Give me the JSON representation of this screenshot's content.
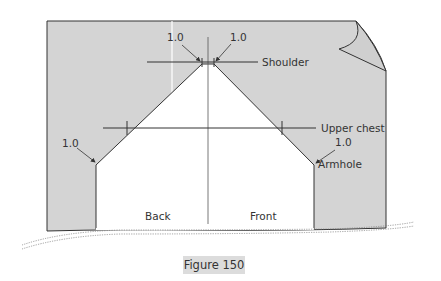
{
  "diagram": {
    "labels": {
      "shoulder": "Shoulder",
      "upper_chest": "Upper chest",
      "armhole": "Armhole",
      "back": "Back",
      "front": "Front"
    },
    "measurements": {
      "shoulder_left": "1.0",
      "shoulder_right": "1.0",
      "armhole_left": "1.0",
      "armhole_right": "1.0"
    },
    "caption": "Figure 150",
    "colors": {
      "fabric": "#d4d4d4",
      "pattern": "#ffffff",
      "line": "#333333",
      "caption_bg": "#dcdcdc"
    }
  }
}
